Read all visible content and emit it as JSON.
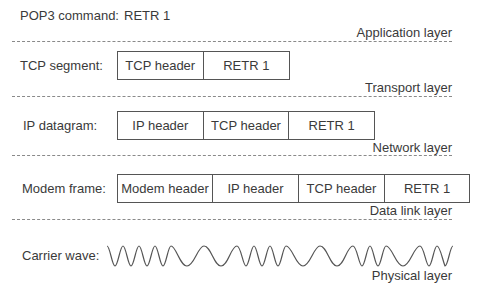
{
  "figure": {
    "colors": {
      "text": "#3a3a3a",
      "box_border": "#555555",
      "dash": "#8a8a8a",
      "wave": "#555555"
    },
    "application": {
      "row_label": "POP3 command:",
      "payload": "RETR 1",
      "layer_name": "Application layer"
    },
    "transport": {
      "row_label": "TCP segment:",
      "cells": [
        "TCP header",
        "RETR 1"
      ],
      "layer_name": "Transport layer"
    },
    "network": {
      "row_label": "IP datagram:",
      "cells": [
        "IP header",
        "TCP header",
        "RETR 1"
      ],
      "layer_name": "Network layer"
    },
    "datalink": {
      "row_label": "Modem frame:",
      "cells": [
        "Modem header",
        "IP header",
        "TCP header",
        "RETR 1"
      ],
      "layer_name": "Data link layer"
    },
    "physical": {
      "row_label": "Carrier wave:",
      "wave_icon": "carrier-wave",
      "layer_name": "Physical layer"
    }
  }
}
